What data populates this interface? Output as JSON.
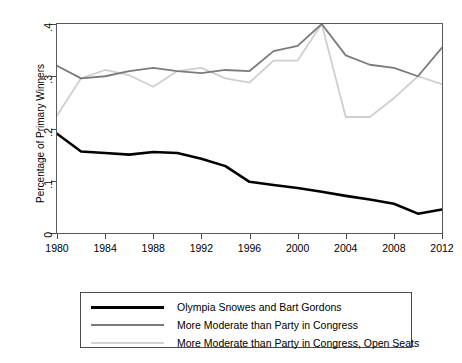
{
  "chart_data": {
    "type": "line",
    "title": "",
    "xlabel": "",
    "ylabel": "Percentage of Primary Winners",
    "xlim": [
      1980,
      2012
    ],
    "ylim": [
      0,
      0.4
    ],
    "grid": false,
    "legend_position": "below-plot",
    "xticks": [
      1980,
      1984,
      1988,
      1992,
      1996,
      2000,
      2004,
      2008,
      2012
    ],
    "xtick_labels": [
      "1980",
      "1984",
      "1988",
      "1992",
      "1996",
      "2000",
      "2004",
      "2008",
      "2012"
    ],
    "yticks": [
      0,
      0.1,
      0.2,
      0.3,
      0.4
    ],
    "ytick_labels": [
      "0",
      ".1",
      ".2",
      ".3",
      ".4"
    ],
    "x": [
      1980,
      1982,
      1984,
      1986,
      1988,
      1990,
      1992,
      1994,
      1996,
      1998,
      2000,
      2002,
      2004,
      2006,
      2008,
      2010,
      2012
    ],
    "series": [
      {
        "name": "Olympia Snowes and Bart Gordons",
        "color": "#000000",
        "width": 2.6,
        "values": [
          0.19,
          0.156,
          0.153,
          0.15,
          0.155,
          0.153,
          0.142,
          0.128,
          0.098,
          0.092,
          0.086,
          0.079,
          0.071,
          0.064,
          0.056,
          0.037,
          0.045
        ]
      },
      {
        "name": "More Moderate than Party in Congress",
        "color": "#7b7b7b",
        "width": 1.8,
        "values": [
          0.32,
          0.296,
          0.3,
          0.31,
          0.316,
          0.31,
          0.306,
          0.312,
          0.31,
          0.348,
          0.358,
          0.4,
          0.34,
          0.322,
          0.316,
          0.3,
          0.355
        ]
      },
      {
        "name": "More Moderate than Party in Congress, Open Seats",
        "color": "#cfcfcf",
        "width": 1.8,
        "values": [
          0.225,
          0.296,
          0.312,
          0.302,
          0.28,
          0.31,
          0.316,
          0.296,
          0.288,
          0.33,
          0.33,
          0.4,
          0.222,
          0.222,
          0.258,
          0.3,
          0.285
        ]
      }
    ]
  },
  "legend": {
    "items": [
      {
        "label": "Olympia Snowes and Bart Gordons",
        "color": "#000000",
        "width": 3
      },
      {
        "label": "More Moderate than Party in Congress",
        "color": "#7b7b7b",
        "width": 2
      },
      {
        "label": "More Moderate than Party in Congress, Open Seats",
        "color": "#d2d2d2",
        "width": 2
      }
    ]
  }
}
